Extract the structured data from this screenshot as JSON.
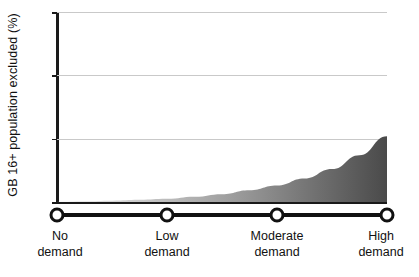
{
  "chart_data": {
    "type": "area",
    "title": "",
    "xlabel": "",
    "ylabel": "GB 16+ population excluded (%)",
    "categories": [
      "No demand",
      "Low demand",
      "Moderate demand",
      "High demand"
    ],
    "category_lines": [
      [
        "No",
        "demand"
      ],
      [
        "Low",
        "demand"
      ],
      [
        "Moderate",
        "demand"
      ],
      [
        "High",
        "demand"
      ]
    ],
    "values": [
      0,
      0.25,
      1.3,
      5.2
    ],
    "x": [
      0,
      1,
      2,
      3
    ],
    "series": [
      {
        "name": "GB 16+ population excluded",
        "values": [
          0,
          0.25,
          1.3,
          5.2
        ]
      }
    ],
    "ylim": [
      0,
      15
    ],
    "yticks": [
      0,
      5,
      10,
      15
    ],
    "ytick_labels": [
      "0",
      "5",
      "10",
      "15"
    ],
    "xlim": [
      0,
      3
    ],
    "grid": true,
    "legend": "none",
    "curve_points": [
      {
        "x": 0.0,
        "y": 0.0
      },
      {
        "x": 0.25,
        "y": 0.05
      },
      {
        "x": 0.5,
        "y": 0.1
      },
      {
        "x": 0.75,
        "y": 0.17
      },
      {
        "x": 1.0,
        "y": 0.25
      },
      {
        "x": 1.25,
        "y": 0.42
      },
      {
        "x": 1.5,
        "y": 0.62
      },
      {
        "x": 1.75,
        "y": 0.93
      },
      {
        "x": 2.0,
        "y": 1.3
      },
      {
        "x": 2.25,
        "y": 1.85
      },
      {
        "x": 2.5,
        "y": 2.6
      },
      {
        "x": 2.75,
        "y": 3.7
      },
      {
        "x": 3.0,
        "y": 5.2
      }
    ],
    "colors": {
      "area_gradient_start": "#f0f0f0",
      "area_gradient_end": "#4a4a4a",
      "gridline": "#c9c9c9",
      "axis": "#1a1a1a",
      "node_fill": "#ffffff",
      "node_stroke": "#111111",
      "text": "#111111",
      "background": "#ffffff"
    }
  }
}
